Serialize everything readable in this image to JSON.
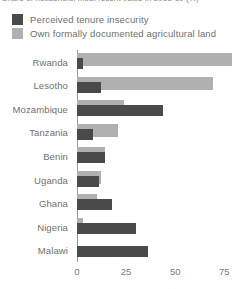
{
  "title": {
    "text": "Share of household, most recent value in 2018-19 (%)",
    "clipped": true
  },
  "legend": {
    "position": "top-left",
    "items": [
      {
        "label": "Perceived tenure insecurity",
        "color": "#4a4a4a",
        "key": "perceived_tenure_insecurity"
      },
      {
        "label": "Own formally documented agricultural land",
        "color": "#b0b0b0",
        "key": "own_formally_documented_agricultural_land"
      }
    ]
  },
  "axis": {
    "x_ticks": [
      "0",
      "25",
      "50",
      "75"
    ],
    "x_tick_values": [
      0,
      25,
      50,
      75
    ],
    "xlim": [
      0,
      85
    ],
    "ylabel": "",
    "xlabel": "",
    "grid": false
  },
  "colors": {
    "dark": "#4a4a4a",
    "light": "#b0b0b0",
    "text": "#6f6f6f",
    "axis": "#9a9a9a",
    "background": "#ffffff"
  },
  "chart_data": {
    "type": "bar",
    "orientation": "horizontal",
    "title": "Share of household, most recent value in 2018-19 (%)",
    "xlabel": "",
    "ylabel": "",
    "xlim": [
      0,
      85
    ],
    "grid": false,
    "legend_position": "top-left",
    "categories": [
      "Rwanda",
      "Lesotho",
      "Mozambique",
      "Tanzania",
      "Benin",
      "Uganda",
      "Ghana",
      "Nigeria",
      "Malawi"
    ],
    "series": [
      {
        "name": "Perceived tenure insecurity",
        "color": "#4a4a4a",
        "values": [
          3,
          12,
          44,
          8,
          14,
          11,
          18,
          30,
          36
        ]
      },
      {
        "name": "Own formally documented agricultural land",
        "color": "#b0b0b0",
        "values": [
          79,
          69,
          24,
          21,
          14,
          12,
          10,
          3,
          0
        ]
      }
    ]
  },
  "rows": [
    {
      "country": "Rwanda",
      "dark": 3,
      "light": 79
    },
    {
      "country": "Lesotho",
      "dark": 12,
      "light": 69
    },
    {
      "country": "Mozambique",
      "dark": 44,
      "light": 24
    },
    {
      "country": "Tanzania",
      "dark": 8,
      "light": 21
    },
    {
      "country": "Benin",
      "dark": 14,
      "light": 14
    },
    {
      "country": "Uganda",
      "dark": 11,
      "light": 12
    },
    {
      "country": "Ghana",
      "dark": 18,
      "light": 10
    },
    {
      "country": "Nigeria",
      "dark": 30,
      "light": 3
    },
    {
      "country": "Malawi",
      "dark": 36,
      "light": 0
    }
  ]
}
